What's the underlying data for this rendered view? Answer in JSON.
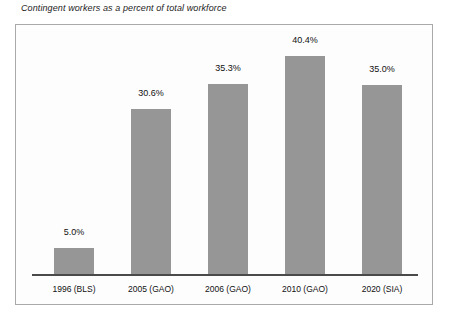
{
  "chart_data": {
    "type": "bar",
    "title": "Contingent workers as a percent of total workforce",
    "xlabel": "",
    "ylabel": "",
    "ylim": [
      0,
      45
    ],
    "grid": false,
    "legend": "none",
    "categories": [
      "1996 (BLS)",
      "2005 (GAO)",
      "2006 (GAO)",
      "2010 (GAO)",
      "2020 (SIA)"
    ],
    "values": [
      5.0,
      30.6,
      35.3,
      40.4,
      35.0
    ],
    "value_labels": [
      "5.0%",
      "30.6%",
      "35.3%",
      "40.4%",
      "35.0%"
    ],
    "bar_color": "#969696",
    "axis_color": "#4a4a4a",
    "frame_color": "#a9a9a9",
    "background": "#fdfdfd"
  },
  "figure": {
    "title": "Contingent workers as a percent of total workforce"
  }
}
